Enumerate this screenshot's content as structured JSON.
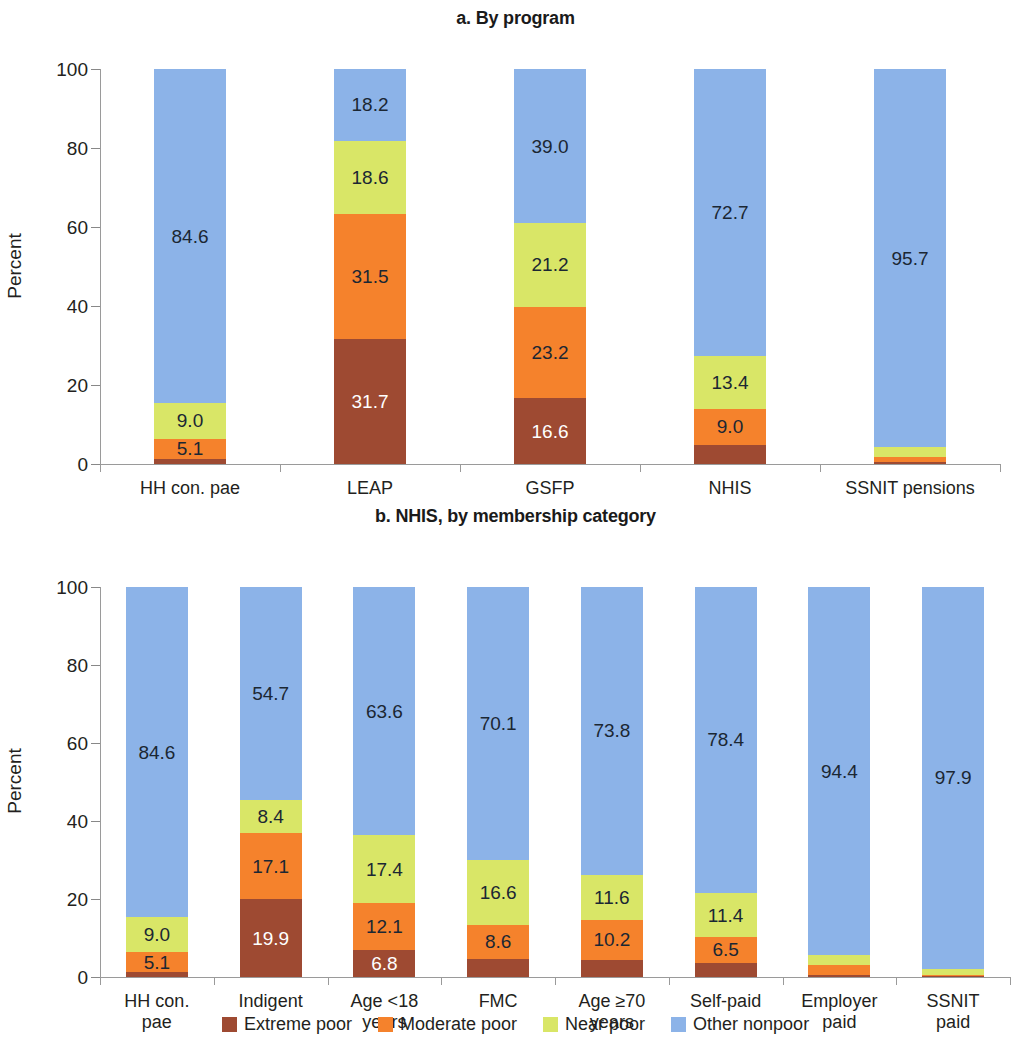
{
  "chart_data": [
    {
      "type": "bar",
      "subtype": "stacked-100-percent",
      "title": "a. By program",
      "xlabel": "",
      "ylabel": "Percent",
      "ylim": [
        0,
        100
      ],
      "yticks": [
        "0",
        "20",
        "40",
        "60",
        "80",
        "100"
      ],
      "grid": false,
      "legend_position": "bottom",
      "categories": [
        "HH con. pae",
        "LEAP",
        "GSFP",
        "NHIS",
        "SSNIT pensions"
      ],
      "series": [
        {
          "name": "Extreme poor",
          "color": "#9E4A32",
          "values": [
            1.3,
            31.7,
            16.6,
            4.9,
            0.6
          ],
          "labels": [
            "",
            "31.7",
            "16.6",
            "",
            ""
          ]
        },
        {
          "name": "Moderate poor",
          "color": "#F5822C",
          "values": [
            5.1,
            31.5,
            23.2,
            9.0,
            1.2
          ],
          "labels": [
            "5.1",
            "31.5",
            "23.2",
            "9.0",
            ""
          ]
        },
        {
          "name": "Near poor",
          "color": "#D9E667",
          "values": [
            9.0,
            18.6,
            21.2,
            13.4,
            2.5
          ],
          "labels": [
            "9.0",
            "18.6",
            "21.2",
            "13.4",
            ""
          ]
        },
        {
          "name": "Other nonpoor",
          "color": "#8CB3E8",
          "values": [
            84.6,
            18.2,
            39.0,
            72.7,
            95.7
          ],
          "labels": [
            "84.6",
            "18.2",
            "39.0",
            "72.7",
            "95.7"
          ]
        }
      ]
    },
    {
      "type": "bar",
      "subtype": "stacked-100-percent",
      "title": "b. NHIS, by membership category",
      "xlabel": "",
      "ylabel": "Percent",
      "ylim": [
        0,
        100
      ],
      "yticks": [
        "0",
        "20",
        "40",
        "60",
        "80",
        "100"
      ],
      "grid": false,
      "legend_position": "bottom",
      "categories": [
        "HH con.\npae",
        "Indigent",
        "Age <18\nyears",
        "FMC",
        "Age ≥70\nyears",
        "Self-paid",
        "Employer\npaid",
        "SSNIT\npaid"
      ],
      "series": [
        {
          "name": "Extreme poor",
          "color": "#9E4A32",
          "values": [
            1.3,
            19.9,
            6.8,
            4.7,
            4.4,
            3.7,
            0.6,
            0.3
          ],
          "labels": [
            "",
            "19.9",
            "6.8",
            "",
            "",
            "",
            "",
            ""
          ]
        },
        {
          "name": "Moderate poor",
          "color": "#F5822C",
          "values": [
            5.1,
            17.1,
            12.1,
            8.6,
            10.2,
            6.5,
            2.5,
            0.3
          ],
          "labels": [
            "5.1",
            "17.1",
            "12.1",
            "8.6",
            "10.2",
            "6.5",
            "",
            ""
          ]
        },
        {
          "name": "Near poor",
          "color": "#D9E667",
          "values": [
            9.0,
            8.4,
            17.4,
            16.6,
            11.6,
            11.4,
            2.5,
            1.5
          ],
          "labels": [
            "9.0",
            "8.4",
            "17.4",
            "16.6",
            "11.6",
            "11.4",
            "",
            ""
          ]
        },
        {
          "name": "Other nonpoor",
          "color": "#8CB3E8",
          "values": [
            84.6,
            54.7,
            63.6,
            70.1,
            73.8,
            78.4,
            94.4,
            97.9
          ],
          "labels": [
            "84.6",
            "54.7",
            "63.6",
            "70.1",
            "73.8",
            "78.4",
            "94.4",
            "97.9"
          ]
        }
      ]
    }
  ],
  "legend": {
    "items": [
      {
        "label": "Extreme poor",
        "color": "#9E4A32"
      },
      {
        "label": "Moderate poor",
        "color": "#F5822C"
      },
      {
        "label": "Near poor",
        "color": "#D9E667"
      },
      {
        "label": "Other nonpoor",
        "color": "#8CB3E8"
      }
    ]
  }
}
